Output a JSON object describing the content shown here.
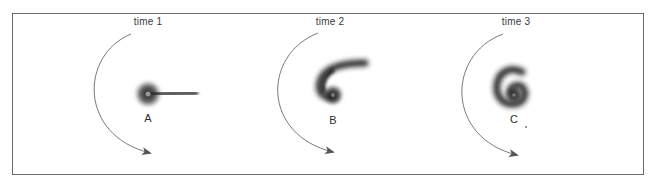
{
  "figure": {
    "panels": [
      {
        "time_label": "time 1",
        "state_label": "A",
        "description": "round blob with straight tail extending right"
      },
      {
        "time_label": "time 2",
        "state_label": "B",
        "description": "tail curved upward into a hook"
      },
      {
        "time_label": "time 3",
        "state_label": "C",
        "description": "tail wound further into a spiral (6 shape)"
      }
    ],
    "rotation_direction": "counterclockwise",
    "colors": {
      "frame": "#6b6b6b",
      "arrow": "#555555",
      "blob": "#1e1e1e",
      "text": "#3a3a3a"
    }
  }
}
